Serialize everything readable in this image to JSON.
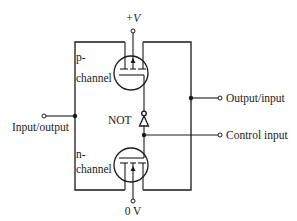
{
  "diagram": {
    "labels": {
      "supply_positive": "+V",
      "supply_ground": "0 V",
      "p_channel_line1": "p-",
      "p_channel_line2": "channel",
      "n_channel_line1": "n-",
      "n_channel_line2": "channel",
      "not_gate": "NOT",
      "left_terminal": "Input/output",
      "right_terminal": "Output/input",
      "control_terminal": "Control input"
    },
    "components": [
      {
        "id": "p-mosfet",
        "type": "p-channel MOSFET",
        "connected_to": [
          "+V",
          "Input/output",
          "Output/input",
          "NOT output"
        ]
      },
      {
        "id": "n-mosfet",
        "type": "n-channel MOSFET",
        "connected_to": [
          "0 V",
          "Input/output",
          "Output/input",
          "Control input"
        ]
      },
      {
        "id": "not-gate",
        "type": "inverter",
        "input": "Control input",
        "output": "p-mosfet gate"
      }
    ],
    "colors": {
      "ink": "#1a1a1a",
      "background": "#ffffff"
    }
  }
}
